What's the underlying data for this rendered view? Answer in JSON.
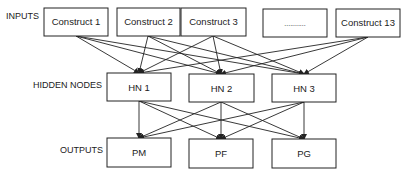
{
  "layers": {
    "inputs": {
      "label": "INPUTS",
      "nodes": [
        "Construct 1",
        "Construct 2",
        "Construct 3",
        "...........",
        "Construct 13"
      ]
    },
    "hidden": {
      "label": "HIDDEN NODES",
      "nodes": [
        "HN 1",
        "HN 2",
        "HN 3"
      ]
    },
    "outputs": {
      "label": "OUTPUTS",
      "nodes": [
        "PM",
        "PF",
        "PG"
      ]
    }
  },
  "connections": {
    "inputs_to_hidden": "all-to-all, excluding ellipsis placeholder",
    "hidden_to_outputs": "all-to-all"
  }
}
